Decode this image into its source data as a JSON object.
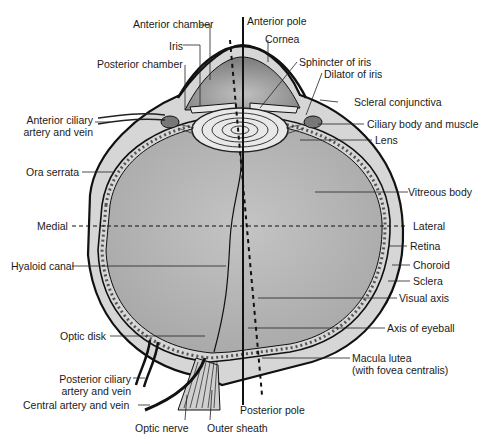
{
  "diagram": {
    "colors": {
      "vitreous": "#b9b9b9",
      "anterior_chamber": "#9e9e9e",
      "sclera": "#d6d6d6",
      "outline": "#111111",
      "background": "#ffffff"
    },
    "labels": {
      "anterior_chamber": "Anterior chamber",
      "anterior_pole": "Anterior pole",
      "iris": "Iris",
      "cornea": "Cornea",
      "posterior_chamber": "Posterior chamber",
      "sphincter_of_iris": "Sphincter of iris",
      "dilator_of_iris": "Dilator of iris",
      "scleral_conjunctiva": "Scleral conjunctiva",
      "anterior_ciliary_1": "Anterior ciliary",
      "anterior_ciliary_2": "artery and vein",
      "ciliary_body": "Ciliary body and muscle",
      "lens": "Lens",
      "ora_serrata": "Ora serrata",
      "vitreous_body": "Vitreous body",
      "medial": "Medial",
      "lateral": "Lateral",
      "retina": "Retina",
      "hyaloid_canal": "Hyaloid canal",
      "choroid": "Choroid",
      "sclera": "Sclera",
      "visual_axis": "Visual axis",
      "optic_disk": "Optic disk",
      "axis_of_eyeball": "Axis of eyeball",
      "macula_1": "Macula lutea",
      "macula_2": "(with fovea centralis)",
      "posterior_ciliary_1": "Posterior ciliary",
      "posterior_ciliary_2": "artery and vein",
      "central_artery": "Central artery and vein",
      "posterior_pole": "Posterior pole",
      "optic_nerve": "Optic nerve",
      "outer_sheath": "Outer sheath"
    }
  }
}
